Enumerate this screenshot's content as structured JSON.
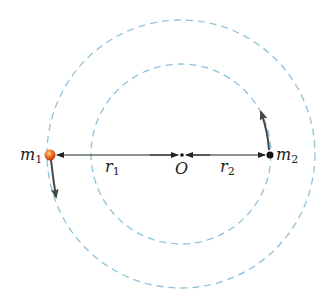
{
  "diagram": {
    "type": "binary-star-orbits",
    "colors": {
      "orbit": "#8ec3dc",
      "line": "#222222",
      "mass1": "#e8501c",
      "mass2": "#111111"
    },
    "center": {
      "label": "O",
      "x": 182,
      "y": 155
    },
    "orbits": [
      {
        "name": "outer-orbit",
        "cx": 181,
        "cy": 154,
        "r": 135,
        "style": "dashed"
      },
      {
        "name": "inner-orbit",
        "cx": 181,
        "cy": 154,
        "r": 90,
        "style": "dashed"
      }
    ],
    "masses": [
      {
        "name": "m1",
        "label": "m",
        "subscript": "1",
        "x": 50,
        "y": 155,
        "velocity": "down"
      },
      {
        "name": "m2",
        "label": "m",
        "subscript": "2",
        "x": 270,
        "y": 155,
        "velocity": "up"
      }
    ],
    "distances": [
      {
        "name": "r1",
        "label": "r",
        "subscript": "1"
      },
      {
        "name": "r2",
        "label": "r",
        "subscript": "2"
      }
    ]
  }
}
